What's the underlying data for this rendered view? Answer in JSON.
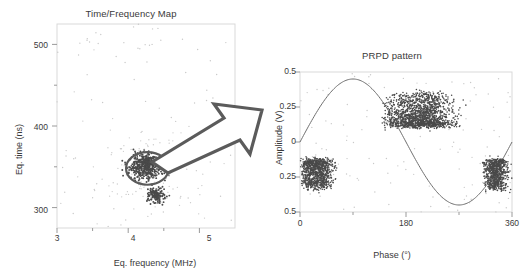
{
  "figure": {
    "background": "#ffffff",
    "arrow": {
      "name": "transition-arrow",
      "color": "#5b5b5b",
      "fill": "#ffffff"
    }
  },
  "chart_data": [
    {
      "type": "scatter",
      "panel": "left",
      "title": "Time/Frequency Map",
      "xlabel": "Eq. frequency (MHz)",
      "ylabel": "Eq. time (ns)",
      "xlim": [
        3,
        5.5
      ],
      "ylim": [
        275,
        525
      ],
      "xticks": [
        3,
        4,
        5
      ],
      "xtick_labels": [
        "3",
        "4",
        "5"
      ],
      "xminor": [
        3.5,
        4.5
      ],
      "yticks": [
        300,
        400,
        500
      ],
      "ytick_labels": [
        "300",
        "400",
        "500"
      ],
      "yminor": [
        350,
        450
      ],
      "grid": false,
      "legend": null,
      "annotations": [
        {
          "type": "ellipse",
          "name": "cluster-highlight-ellipse",
          "cx": 4.27,
          "cy": 348,
          "rx": 0.3,
          "ry": 20
        }
      ],
      "clusters": [
        {
          "name": "main-cluster",
          "cx": 4.25,
          "cy": 349,
          "sx": 0.11,
          "sy": 7,
          "n": 420,
          "density": "high"
        },
        {
          "name": "upper-lobe",
          "cx": 4.26,
          "cy": 356,
          "sx": 0.07,
          "sy": 4,
          "n": 150,
          "density": "high"
        },
        {
          "name": "lower-cluster",
          "cx": 4.4,
          "cy": 316,
          "sx": 0.07,
          "sy": 5,
          "n": 150,
          "density": "high"
        },
        {
          "name": "sparse-halo",
          "cx": 4.3,
          "cy": 345,
          "sx": 0.35,
          "sy": 30,
          "n": 120,
          "density": "low"
        }
      ],
      "noise": {
        "name": "background-noise",
        "n": 90,
        "density": "very-low"
      }
    },
    {
      "type": "scatter",
      "panel": "right",
      "title": "PRPD pattern",
      "xlabel": "Phase (°)",
      "ylabel": "Amplitude (V)",
      "xlim": [
        0,
        360
      ],
      "ylim": [
        -0.5,
        0.5
      ],
      "xticks": [
        0,
        180,
        360
      ],
      "xtick_labels": [
        "0",
        "180",
        "360"
      ],
      "xminor": [
        90,
        270
      ],
      "yticks": [
        0.5,
        0.25,
        0,
        -0.25,
        -0.5
      ],
      "ytick_labels": [
        "0.5",
        "0.25",
        "0",
        "0.25",
        "0.5"
      ],
      "grid": false,
      "legend": null,
      "reference_wave": {
        "name": "voltage-sine-wave",
        "type": "sine",
        "amplitude": 0.45,
        "period_deg": 360,
        "phase_offset_deg": 0,
        "color": "#6f6f6f"
      },
      "clusters": [
        {
          "name": "positive-cluster",
          "phase_range": [
            138,
            300
          ],
          "amp_range": [
            0.12,
            0.35
          ],
          "peak_phase": 190,
          "n": 1500,
          "polarity": "positive"
        },
        {
          "name": "negative-cluster-early",
          "phase_range": [
            0,
            78
          ],
          "amp_range": [
            -0.33,
            -0.13
          ],
          "peak_phase": 10,
          "n": 900,
          "polarity": "negative"
        },
        {
          "name": "negative-cluster-late",
          "phase_range": [
            308,
            360
          ],
          "amp_range": [
            -0.34,
            -0.13
          ],
          "peak_phase": 345,
          "n": 700,
          "polarity": "negative"
        }
      ],
      "noise": {
        "name": "background-noise",
        "n": 120,
        "density": "very-low"
      }
    }
  ]
}
